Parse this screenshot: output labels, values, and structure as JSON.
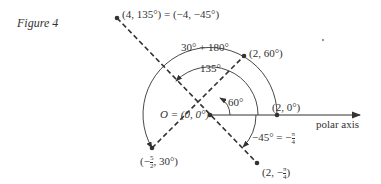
{
  "figure": {
    "caption": "Figure 4",
    "labels": {
      "p135": "(4, 135°) = (−4, −45°)",
      "arc_outer": "30° + 180°",
      "arc_inner": "135°",
      "p60": "(2, 60°)",
      "angle60": "60°",
      "origin": "O = (0, 0°)",
      "p0": "(2, 0°)",
      "polar_axis": "polar axis",
      "neg45_prefix": "−45° = −",
      "neg45_num": "π",
      "neg45_den": "4",
      "pneg_prefix": "(2, −",
      "pneg_num": "π",
      "pneg_den": "4",
      "pneg_suffix": ")",
      "p30_prefix": "(−",
      "p30_num": "5",
      "p30_den": "2",
      "p30_suffix": ", 30°)"
    },
    "colors": {
      "ink": "#333333",
      "background": "#ffffff"
    }
  }
}
